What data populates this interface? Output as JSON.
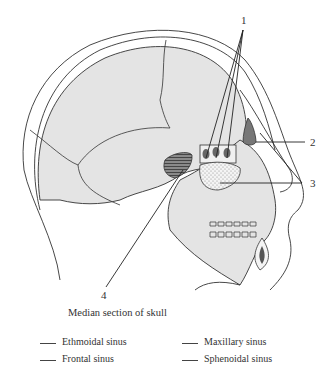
{
  "diagram": {
    "caption": "Median section of skull",
    "callouts": [
      {
        "number": "1",
        "target": "ethmoidal air cells"
      },
      {
        "number": "2",
        "target": "frontal region sinus"
      },
      {
        "number": "3",
        "target": "stippled sinus below ethmoid"
      },
      {
        "number": "4",
        "target": "hatched sinus behind nasal cavity"
      }
    ],
    "colors": {
      "bone_fill": "#e4e4e4",
      "outline": "#333333",
      "sinus_dark": "#777777"
    }
  },
  "legend": {
    "items": [
      {
        "label": "Ethmoidal sinus",
        "answer": ""
      },
      {
        "label": "Frontal sinus",
        "answer": ""
      },
      {
        "label": "Maxillary sinus",
        "answer": ""
      },
      {
        "label": "Sphenoidal sinus",
        "answer": ""
      }
    ]
  }
}
